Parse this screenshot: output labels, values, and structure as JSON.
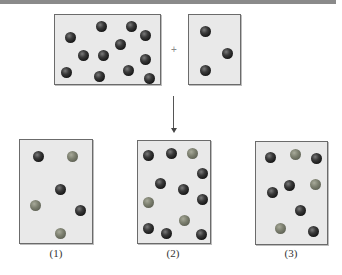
{
  "diagram": {
    "reactants": {
      "box_a": {
        "balls": [
          {
            "x": 15,
            "y": 22,
            "type": "dark"
          },
          {
            "x": 46,
            "y": 11,
            "type": "dark"
          },
          {
            "x": 76,
            "y": 11,
            "type": "dark"
          },
          {
            "x": 90,
            "y": 20,
            "type": "dark"
          },
          {
            "x": 65,
            "y": 29,
            "type": "dark"
          },
          {
            "x": 28,
            "y": 40,
            "type": "dark"
          },
          {
            "x": 48,
            "y": 40,
            "type": "dark"
          },
          {
            "x": 90,
            "y": 44,
            "type": "dark"
          },
          {
            "x": 11,
            "y": 57,
            "type": "dark"
          },
          {
            "x": 44,
            "y": 61,
            "type": "dark"
          },
          {
            "x": 73,
            "y": 55,
            "type": "dark"
          },
          {
            "x": 94,
            "y": 63,
            "type": "dark"
          }
        ]
      },
      "operator": "+",
      "box_b": {
        "balls": [
          {
            "x": 16,
            "y": 16,
            "type": "dark"
          },
          {
            "x": 38,
            "y": 38,
            "type": "dark"
          },
          {
            "x": 16,
            "y": 55,
            "type": "dark"
          }
        ]
      }
    },
    "arrow": "down",
    "products": [
      {
        "label": "(1)",
        "balls": [
          {
            "x": 18,
            "y": 16,
            "type": "dark"
          },
          {
            "x": 52,
            "y": 16,
            "type": "light"
          },
          {
            "x": 40,
            "y": 49,
            "type": "dark"
          },
          {
            "x": 15,
            "y": 65,
            "type": "light"
          },
          {
            "x": 60,
            "y": 70,
            "type": "dark"
          },
          {
            "x": 40,
            "y": 93,
            "type": "light"
          }
        ]
      },
      {
        "label": "(2)",
        "balls": [
          {
            "x": 10,
            "y": 14,
            "type": "dark"
          },
          {
            "x": 33,
            "y": 12,
            "type": "dark"
          },
          {
            "x": 54,
            "y": 12,
            "type": "light"
          },
          {
            "x": 64,
            "y": 32,
            "type": "dark"
          },
          {
            "x": 22,
            "y": 42,
            "type": "dark"
          },
          {
            "x": 45,
            "y": 48,
            "type": "dark"
          },
          {
            "x": 64,
            "y": 58,
            "type": "dark"
          },
          {
            "x": 10,
            "y": 61,
            "type": "light"
          },
          {
            "x": 46,
            "y": 79,
            "type": "light"
          },
          {
            "x": 10,
            "y": 87,
            "type": "dark"
          },
          {
            "x": 28,
            "y": 92,
            "type": "dark"
          },
          {
            "x": 63,
            "y": 93,
            "type": "dark"
          }
        ]
      },
      {
        "label": "(3)",
        "balls": [
          {
            "x": 14,
            "y": 15,
            "type": "dark"
          },
          {
            "x": 39,
            "y": 12,
            "type": "light"
          },
          {
            "x": 60,
            "y": 16,
            "type": "dark"
          },
          {
            "x": 33,
            "y": 43,
            "type": "dark"
          },
          {
            "x": 59,
            "y": 42,
            "type": "light"
          },
          {
            "x": 16,
            "y": 50,
            "type": "dark"
          },
          {
            "x": 44,
            "y": 68,
            "type": "dark"
          },
          {
            "x": 24,
            "y": 86,
            "type": "light"
          },
          {
            "x": 57,
            "y": 89,
            "type": "dark"
          }
        ]
      }
    ]
  },
  "colors": {
    "dark_ball": "#1a1a1a",
    "light_ball": "#7d8070",
    "box_fill": "#e9e9e9",
    "box_border": "#6b6b6b",
    "top_bar": "#8a8a8a"
  }
}
